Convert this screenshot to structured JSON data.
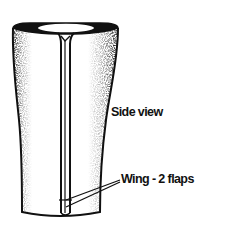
{
  "diagram": {
    "labels": {
      "side_view": "Side view",
      "wing": "Wing - 2 flaps"
    },
    "colors": {
      "ink": "#111111",
      "paper": "#ffffff"
    }
  }
}
